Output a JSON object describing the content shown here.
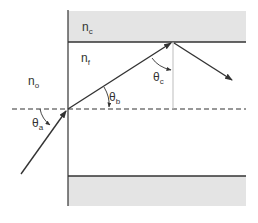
{
  "diagram": {
    "colors": {
      "cladding_fill": "#e4e4e4",
      "line": "#333333",
      "normal_line": "#bdbdbd",
      "background": "#ffffff"
    },
    "regions": {
      "cladding": {
        "symbol": "n",
        "subscript": "c"
      },
      "film": {
        "symbol": "n",
        "subscript": "f"
      },
      "outside": {
        "symbol": "n",
        "subscript": "o"
      }
    },
    "angles": {
      "incidence": {
        "symbol": "θ",
        "subscript": "a"
      },
      "refracted": {
        "symbol": "θ",
        "subscript": "b"
      },
      "critical": {
        "symbol": "θ",
        "subscript": "c"
      }
    },
    "elements": [
      "incident-ray",
      "refracted-ray",
      "reflected-ray",
      "optical-axis (dashed)",
      "normal-at-reflection-point",
      "entrance-face",
      "upper-cladding",
      "lower-cladding"
    ]
  }
}
